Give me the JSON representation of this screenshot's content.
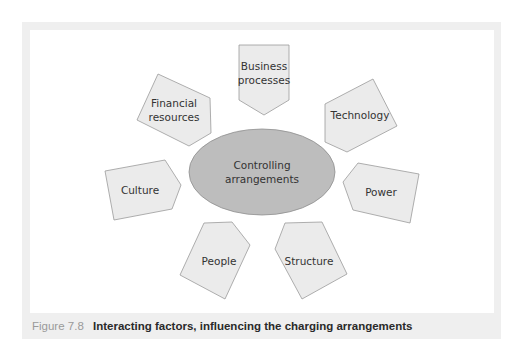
{
  "figure": {
    "number": "Figure 7.8",
    "caption": "Interacting factors, influencing the charging arrangements"
  },
  "diagram": {
    "center": {
      "label_line1": "Controlling",
      "label_line2": "arrangements",
      "fill": "#bdbdbd"
    },
    "factors": [
      {
        "id": "business-processes",
        "line1": "Business",
        "line2": "processes"
      },
      {
        "id": "technology",
        "line1": "Technology",
        "line2": ""
      },
      {
        "id": "power",
        "line1": "Power",
        "line2": ""
      },
      {
        "id": "structure",
        "line1": "Structure",
        "line2": ""
      },
      {
        "id": "people",
        "line1": "People",
        "line2": ""
      },
      {
        "id": "culture",
        "line1": "Culture",
        "line2": ""
      },
      {
        "id": "financial-resources",
        "line1": "Financial",
        "line2": "resources"
      }
    ],
    "factor_fill": "#ebebeb",
    "stroke": "#9a9a9a"
  }
}
